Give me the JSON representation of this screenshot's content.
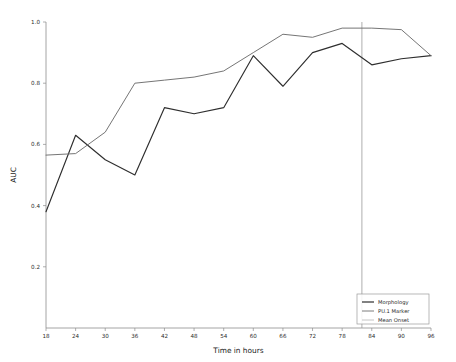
{
  "chart_data": {
    "type": "line",
    "title": "",
    "xlabel": "Time in hours",
    "ylabel": "AUC",
    "xlim": [
      18,
      96
    ],
    "ylim": [
      0.0,
      1.0
    ],
    "grid": false,
    "legend_position": "lower right",
    "x": [
      18,
      24,
      30,
      36,
      42,
      48,
      54,
      60,
      66,
      72,
      78,
      84,
      90,
      96
    ],
    "xticks": [
      "18",
      "24",
      "30",
      "36",
      "42",
      "48",
      "54",
      "60",
      "66",
      "72",
      "78",
      "84",
      "90",
      "96"
    ],
    "yticks": [
      "0.2",
      "0.4",
      "0.6",
      "0.8",
      "1.0"
    ],
    "ytick_values": [
      0.2,
      0.4,
      0.6,
      0.8,
      1.0
    ],
    "series": [
      {
        "name": "Morphology",
        "color": "#2e2e2e",
        "values": [
          0.38,
          0.63,
          0.55,
          0.5,
          0.72,
          0.7,
          0.72,
          0.89,
          0.79,
          0.9,
          0.93,
          0.86,
          0.88,
          0.89
        ]
      },
      {
        "name": "PU.1 Marker",
        "color": "#6e6e6e",
        "values": [
          0.565,
          0.57,
          0.64,
          0.8,
          0.81,
          0.82,
          0.84,
          0.9,
          0.96,
          0.95,
          0.98,
          0.98,
          0.975,
          0.89
        ]
      }
    ],
    "annotations": [
      {
        "name": "Mean Onset",
        "type": "vline",
        "x": 82,
        "color": "#9a9a9a"
      }
    ],
    "legend": [
      {
        "label": "Morphology",
        "color": "#2e2e2e"
      },
      {
        "label": "PU.1 Marker",
        "color": "#6e6e6e"
      },
      {
        "label": "Mean Onset",
        "color": "#bdbdbd"
      }
    ]
  }
}
